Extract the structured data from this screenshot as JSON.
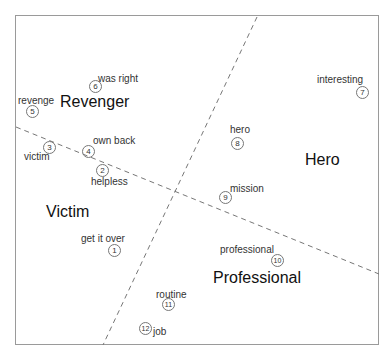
{
  "diagram": {
    "regions": [
      {
        "label": "Revenger",
        "x": 60,
        "y": 94
      },
      {
        "label": "Victim",
        "x": 46,
        "y": 204
      },
      {
        "label": "Hero",
        "x": 305,
        "y": 152
      },
      {
        "label": "Professional",
        "x": 213,
        "y": 270
      }
    ],
    "items": [
      {
        "n": "1",
        "word": "get it over",
        "cx": 114,
        "cy": 250,
        "lx": 81,
        "ly": 234
      },
      {
        "n": "2",
        "word": "helpless",
        "cx": 102,
        "cy": 170,
        "lx": 91,
        "ly": 177
      },
      {
        "n": "3",
        "word": "victim",
        "cx": 49,
        "cy": 147,
        "lx": 24,
        "ly": 152
      },
      {
        "n": "4",
        "word": "own back",
        "cx": 88,
        "cy": 151,
        "lx": 93,
        "ly": 136
      },
      {
        "n": "5",
        "word": "revenge",
        "cx": 32,
        "cy": 111,
        "lx": 18,
        "ly": 96
      },
      {
        "n": "6",
        "word": "was right",
        "cx": 95,
        "cy": 86,
        "lx": 98,
        "ly": 74
      },
      {
        "n": "7",
        "word": "interesting",
        "cx": 362,
        "cy": 92,
        "lx": 317,
        "ly": 75
      },
      {
        "n": "8",
        "word": "hero",
        "cx": 237,
        "cy": 143,
        "lx": 230,
        "ly": 125
      },
      {
        "n": "9",
        "word": "mission",
        "cx": 225,
        "cy": 197,
        "lx": 230,
        "ly": 184
      },
      {
        "n": "10",
        "word": "professional",
        "cx": 277,
        "cy": 260,
        "lx": 220,
        "ly": 245
      },
      {
        "n": "11",
        "word": "routine",
        "cx": 168,
        "cy": 304,
        "lx": 156,
        "ly": 290
      },
      {
        "n": "12",
        "word": "job",
        "cx": 145,
        "cy": 328,
        "lx": 153,
        "ly": 327
      }
    ],
    "lines": [
      {
        "x1": 257,
        "y1": 17,
        "x2": 103,
        "y2": 345
      },
      {
        "x1": 16,
        "y1": 127,
        "x2": 379,
        "y2": 274
      }
    ]
  }
}
